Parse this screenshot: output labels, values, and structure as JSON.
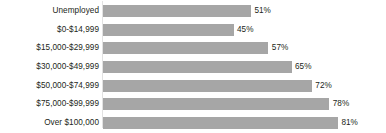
{
  "chart_data": {
    "type": "bar",
    "orientation": "horizontal",
    "title": "",
    "subtitle": "",
    "xlabel": "",
    "ylabel": "",
    "grid": false,
    "legend": null,
    "xlim": [
      0,
      100
    ],
    "value_suffix": "%",
    "categories": [
      "Unemployed",
      "$0-$14,999",
      "$15,000-$29,999",
      "$30,000-$49,999",
      "$50,000-$74,999",
      "$75,000-$99,999",
      "Over $100,000"
    ],
    "values": [
      51,
      45,
      57,
      65,
      72,
      78,
      81
    ],
    "data_labels": [
      "51%",
      "45%",
      "57%",
      "65%",
      "72%",
      "78%",
      "81%"
    ],
    "colors": {
      "bar": "#a6a6a6",
      "text": "#231f20",
      "background": "#ffffff",
      "axis_line": "#e2e2e2"
    }
  },
  "rows": [
    {
      "label": "Unemployed",
      "value": 51,
      "value_label": "51%"
    },
    {
      "label": "$0-$14,999",
      "value": 45,
      "value_label": "45%"
    },
    {
      "label": "$15,000-$29,999",
      "value": 57,
      "value_label": "57%"
    },
    {
      "label": "$30,000-$49,999",
      "value": 65,
      "value_label": "65%"
    },
    {
      "label": "$50,000-$74,999",
      "value": 72,
      "value_label": "72%"
    },
    {
      "label": "$75,000-$99,999",
      "value": 78,
      "value_label": "78%"
    },
    {
      "label": "Over $100,000",
      "value": 81,
      "value_label": "81%"
    }
  ]
}
